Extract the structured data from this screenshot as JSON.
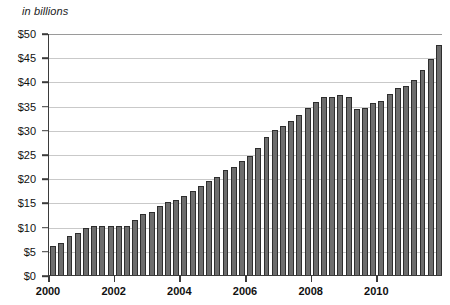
{
  "chart_data": {
    "type": "bar",
    "title": "in billions",
    "xlabel": "",
    "ylabel": "",
    "ylim": [
      0,
      50
    ],
    "grid": true,
    "legend": null,
    "y_ticks": [
      "$0",
      "$5",
      "$10",
      "$15",
      "$20",
      "$25",
      "$30",
      "$35",
      "$40",
      "$45",
      "$50"
    ],
    "y_tick_values": [
      0,
      5,
      10,
      15,
      20,
      25,
      30,
      35,
      40,
      45,
      50
    ],
    "x_tick_labels": [
      "2000",
      "2002",
      "2004",
      "2006",
      "2008",
      "2010"
    ],
    "x_tick_values": [
      2000,
      2002,
      2004,
      2006,
      2008,
      2010
    ],
    "x_range": [
      2000,
      2011.75
    ],
    "frequency": "quarterly",
    "bar_color": "#6d6d6d",
    "bar_edge_color": "#2e2e2e",
    "grid_color": "#c9c9c9",
    "axis_color": "#3b3b3b",
    "categories": [
      "2000 Q1",
      "2000 Q2",
      "2000 Q3",
      "2000 Q4",
      "2001 Q1",
      "2001 Q2",
      "2001 Q3",
      "2001 Q4",
      "2002 Q1",
      "2002 Q2",
      "2002 Q3",
      "2002 Q4",
      "2003 Q1",
      "2003 Q2",
      "2003 Q3",
      "2003 Q4",
      "2004 Q1",
      "2004 Q2",
      "2004 Q3",
      "2004 Q4",
      "2005 Q1",
      "2005 Q2",
      "2005 Q3",
      "2005 Q4",
      "2006 Q1",
      "2006 Q2",
      "2006 Q3",
      "2006 Q4",
      "2007 Q1",
      "2007 Q2",
      "2007 Q3",
      "2007 Q4",
      "2008 Q1",
      "2008 Q2",
      "2008 Q3",
      "2008 Q4",
      "2009 Q1",
      "2009 Q2",
      "2009 Q3",
      "2009 Q4",
      "2010 Q1",
      "2010 Q2",
      "2010 Q3",
      "2010 Q4",
      "2011 Q1",
      "2011 Q2",
      "2011 Q3",
      "2011 Q4"
    ],
    "values": [
      6.0,
      6.6,
      8.0,
      8.6,
      9.8,
      10.2,
      10.2,
      10.2,
      10.2,
      10.2,
      11.4,
      12.6,
      13.0,
      14.2,
      15.0,
      15.6,
      16.4,
      17.4,
      18.4,
      19.4,
      20.2,
      21.6,
      22.4,
      23.6,
      24.6,
      26.2,
      28.6,
      30.0,
      30.8,
      31.8,
      33.0,
      34.6,
      35.8,
      36.8,
      36.8,
      37.2,
      36.8,
      34.2,
      34.6,
      35.6,
      36.0,
      37.4,
      38.6,
      39.0,
      40.2,
      42.4,
      44.6,
      47.6
    ]
  }
}
